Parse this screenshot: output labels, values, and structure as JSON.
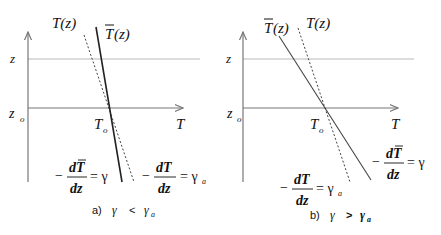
{
  "panels": [
    {
      "id": "a",
      "curve_labels": {
        "environment": "T(z)",
        "parcel": "T",
        "parcel_arg": "(z)"
      },
      "axis_labels": {
        "z": "z",
        "z0": "z",
        "z0_sub": "o",
        "T0": "T",
        "T0_sub": "o",
        "T": "T"
      },
      "eq_parcel": {
        "minus": "−",
        "num": "dT",
        "den": "dz",
        "rhs": "= γ"
      },
      "eq_env": {
        "minus": "−",
        "num": "dT",
        "den": "dz",
        "rhs": "= γ",
        "rhs_sub": "a"
      },
      "caption": {
        "prefix": "a)",
        "lhs": "γ",
        "op": "<",
        "rhs": "γ",
        "rhs_sub": "a"
      }
    },
    {
      "id": "b",
      "curve_labels": {
        "environment": "T(z)",
        "parcel": "T",
        "parcel_arg": "(z)"
      },
      "axis_labels": {
        "z": "z",
        "z0": "z",
        "z0_sub": "o",
        "T0": "T",
        "T0_sub": "o",
        "T": "T"
      },
      "eq_parcel": {
        "minus": "−",
        "num": "dT",
        "den": "dz",
        "rhs": "= γ"
      },
      "eq_env": {
        "minus": "−",
        "num": "dT",
        "den": "dz",
        "rhs": "= γ",
        "rhs_sub": "a"
      },
      "caption": {
        "prefix": "b)",
        "lhs": "γ",
        "op": ">",
        "rhs": "γ",
        "rhs_sub": "a"
      }
    }
  ]
}
